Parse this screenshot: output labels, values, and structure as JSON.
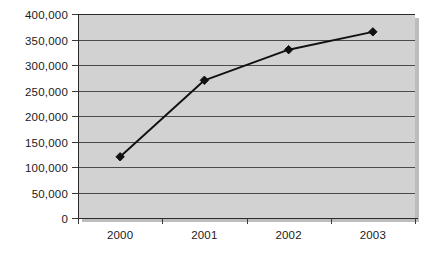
{
  "chart_data": {
    "type": "line",
    "title": "",
    "subtitle": "",
    "xlabel": "",
    "ylabel": "",
    "categories": [
      "2000",
      "2001",
      "2002",
      "2003"
    ],
    "series": [
      {
        "name": "Series 1",
        "values": [
          120000,
          270000,
          330000,
          365000
        ]
      }
    ],
    "ylim": [
      0,
      400000
    ],
    "ytick_values": [
      0,
      50000,
      100000,
      150000,
      200000,
      250000,
      300000,
      350000,
      400000
    ],
    "ytick_labels": [
      "0",
      "50,000",
      "100,000",
      "150,000",
      "200,000",
      "250,000",
      "300,000",
      "350,000",
      "400,000"
    ],
    "xtick_labels": [
      "2000",
      "2001",
      "2002",
      "2003"
    ],
    "grid": true,
    "grid_axis": "y",
    "legend": false,
    "legend_position": "none",
    "marker": "diamond",
    "colors": {
      "line": "#111111",
      "marker": "#111111",
      "plot_background": "#d2d2d2",
      "gridline": "#4a4a4a",
      "axis": "#2b2b2b",
      "text": "#1a1a1a",
      "page_background": "#ffffff"
    }
  }
}
